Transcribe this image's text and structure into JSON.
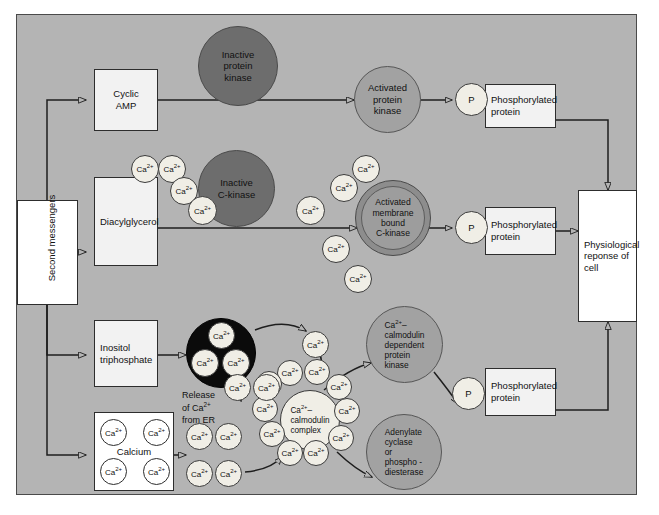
{
  "figure": {
    "background_color": "#b4b4b4",
    "frame_border_color": "#4a4a4a"
  },
  "colors": {
    "inactive_circle": "#6d6d6d",
    "activated_circle": "#a2a2a2",
    "er_circle": "#0b0b0b",
    "calcium_circle": "#f0eee6",
    "box_fill": "#f2f2f2",
    "output_box_fill": "#ffffff",
    "line": "#1e1e1e"
  },
  "nodes": {
    "second_messengers": {
      "label": "Second messengers",
      "type": "rect-rotated"
    },
    "cyclic_amp": {
      "label": "Cyclic\nAMP",
      "type": "rect"
    },
    "diacylglycerol": {
      "label": "Diacylglycerol",
      "type": "rect"
    },
    "inositol_triphosphate": {
      "label": "Inositol\ntriphosphate",
      "type": "rect"
    },
    "calcium": {
      "label": "Calcium",
      "type": "rect"
    },
    "inactive_protein_kinase": {
      "label": "Inactive\nprotein\nkinase",
      "type": "circle"
    },
    "inactive_c_kinase": {
      "label": "Inactive\nC-kinase",
      "type": "circle"
    },
    "activated_protein_kinase": {
      "label": "Activated\nprotein\nkinase",
      "type": "circle"
    },
    "activated_membrane_bound_c_kinase": {
      "label": "Activated\nmembrane\nbound\nC-kinase",
      "type": "circle-ringed"
    },
    "ca_calmodulin_dependent_protein_kinase": {
      "label": "Ca²⁺–\ncalmodulin\ndependent\nprotein\nkinase",
      "type": "circle"
    },
    "adenylate_cyclase_or_phosphodiesterase": {
      "label": "Adenylate\ncyclase\nor\nphospho -\ndiesterase",
      "type": "circle"
    },
    "ca_calmodulin_complex": {
      "label": "Ca²⁺–\ncalmodulin\ncomplex",
      "type": "circle"
    },
    "er_store": {
      "label": "",
      "type": "circle",
      "note": "black vesicle holding three Ca²⁺"
    },
    "release_caption": {
      "label": "Release\nof Ca²⁺\nfrom ER"
    },
    "phospho_protein_1": {
      "label": "Phosphorylated\nprotein",
      "type": "rect"
    },
    "phospho_protein_2": {
      "label": "Phosphorylated\nprotein",
      "type": "rect"
    },
    "phospho_protein_3": {
      "label": "Phosphorylated\nprotein",
      "type": "rect"
    },
    "phosphate_1": {
      "label": "P",
      "type": "circle"
    },
    "phosphate_2": {
      "label": "P",
      "type": "circle"
    },
    "phosphate_3": {
      "label": "P",
      "type": "circle"
    },
    "physiological_response": {
      "label": "Physiological\nreponse of\ncell",
      "type": "rect"
    }
  },
  "labels": {
    "second_messengers": "Second messengers",
    "cyclic_amp_line1": "Cyclic",
    "cyclic_amp_line2": "AMP",
    "diacylglycerol": "Diacylglycerol",
    "inositol_line1": "Inositol",
    "inositol_line2": "triphosphate",
    "calcium": "Calcium",
    "inactive_pk_line1": "Inactive",
    "inactive_pk_line2": "protein",
    "inactive_pk_line3": "kinase",
    "inactive_ck_line1": "Inactive",
    "inactive_ck_line2": "C-kinase",
    "activated_pk_line1": "Activated",
    "activated_pk_line2": "protein",
    "activated_pk_line3": "kinase",
    "activated_ck_line1": "Activated",
    "activated_ck_line2": "membrane",
    "activated_ck_line3": "bound",
    "activated_ck_line4": "C-kinase",
    "cam_kinase_line1": "Ca2+–",
    "cam_kinase_line2": "calmodulin",
    "cam_kinase_line3": "dependent",
    "cam_kinase_line4": "protein",
    "cam_kinase_line5": "kinase",
    "adenylate_line1": "Adenylate",
    "adenylate_line2": "cyclase",
    "adenylate_line3": "or",
    "adenylate_line4": "phospho -",
    "adenylate_line5": "diesterase",
    "cam_complex_line1": "Ca2+–",
    "cam_complex_line2": "calmodulin",
    "cam_complex_line3": "complex",
    "release_line1": "Release",
    "release_line2": "of Ca2+",
    "release_line3": "from ER",
    "phospho_line1": "Phosphorylated",
    "phospho_line2": "protein",
    "phosphate": "P",
    "response_line1": "Physiological",
    "response_line2": "reponse of",
    "response_line3": "cell",
    "calcium_ion": "Ca",
    "calcium_charge": "2+"
  },
  "calcium_ions": {
    "ion_label": "Ca2+",
    "inside_calcium_box": 4,
    "inside_er_vesicle": 3,
    "around_diacylglycerol": 4,
    "around_activated_c_kinase": 5,
    "around_calmodulin_complex": 10,
    "free_floating": 9
  },
  "connections": [
    {
      "from": "second_messengers",
      "to": "cyclic_amp"
    },
    {
      "from": "second_messengers",
      "to": "diacylglycerol"
    },
    {
      "from": "second_messengers",
      "to": "inositol_triphosphate"
    },
    {
      "from": "second_messengers",
      "to": "calcium"
    },
    {
      "from": "cyclic_amp",
      "to": "activated_protein_kinase"
    },
    {
      "from": "diacylglycerol",
      "to": "activated_membrane_bound_c_kinase"
    },
    {
      "from": "activated_protein_kinase",
      "to": "phosphate_1"
    },
    {
      "from": "activated_membrane_bound_c_kinase",
      "to": "phosphate_2"
    },
    {
      "from": "phospho_protein_1",
      "to": "physiological_response"
    },
    {
      "from": "phospho_protein_2",
      "to": "physiological_response"
    },
    {
      "from": "phospho_protein_3",
      "to": "physiological_response"
    },
    {
      "from": "inositol_triphosphate",
      "to": "er_store"
    },
    {
      "from": "calcium",
      "to": "free_calcium_pool"
    },
    {
      "from": "ca_calmodulin_complex",
      "to": "ca_calmodulin_dependent_protein_kinase"
    },
    {
      "from": "ca_calmodulin_complex",
      "to": "adenylate_cyclase_or_phosphodiesterase"
    },
    {
      "from": "ca_calmodulin_dependent_protein_kinase",
      "to": "phosphate_3"
    }
  ]
}
